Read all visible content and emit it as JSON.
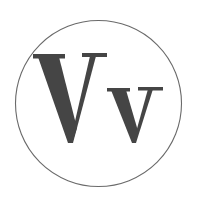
{
  "figure": {
    "letters": {
      "uppercase": "V",
      "lowercase": "v"
    },
    "colors": {
      "ink": "#454545",
      "ring": "#6a6a6a",
      "background": "#ffffff"
    }
  }
}
